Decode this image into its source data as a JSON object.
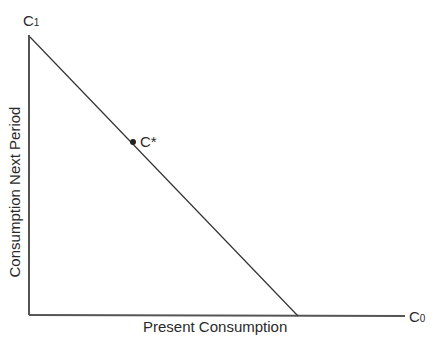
{
  "diagram": {
    "y_axis_label": "Consumption Next Period",
    "x_axis_label": "Present Consumption",
    "y_axis_end_label": {
      "base": "C",
      "sub": "1"
    },
    "x_axis_end_label": {
      "base": "C",
      "sub": "0"
    },
    "point_label": "C*",
    "line_color": "#333333"
  }
}
